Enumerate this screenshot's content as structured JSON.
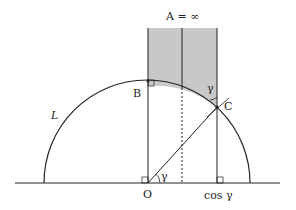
{
  "diagram": {
    "title_label": "A = ∞",
    "labels": {
      "A": "A = ∞",
      "B": "B",
      "C": "C",
      "O": "O",
      "L": "L",
      "gamma_origin": "γ",
      "gamma_top": "γ",
      "cos_gamma": "cos γ"
    },
    "colors": {
      "stroke": "#222222",
      "shade": "#c8c8c8",
      "background": "#ffffff"
    }
  }
}
